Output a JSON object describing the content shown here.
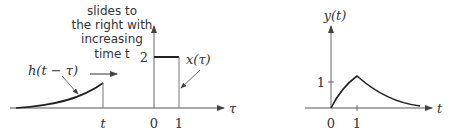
{
  "left_panel": {
    "annotation_lines": [
      "slides to",
      "the right with",
      "increasing",
      "time t"
    ],
    "h_label": "h(t − τ)",
    "x_label": "x(τ)",
    "axis_label": "τ",
    "tick_t": "t",
    "tick_0": "0",
    "tick_1": "1",
    "level_label": "2"
  },
  "right_panel": {
    "y_axis_label": "y(t)",
    "x_axis_label": "t",
    "tick_0": "0",
    "tick_1": "1",
    "level_label": "1"
  },
  "colors": {
    "curve": "#222222",
    "axis": "#555555"
  }
}
